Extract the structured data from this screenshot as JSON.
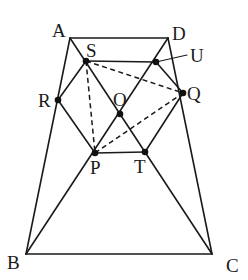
{
  "figure": {
    "type": "geometry-diagram"
  },
  "points": {
    "A": {
      "label": "A",
      "x": 70,
      "y": 38
    },
    "D": {
      "label": "D",
      "x": 168,
      "y": 38
    },
    "B": {
      "label": "B",
      "x": 26,
      "y": 254
    },
    "C": {
      "label": "C",
      "x": 212,
      "y": 254
    },
    "S": {
      "label": "S",
      "x": 86,
      "y": 61
    },
    "U": {
      "label": "U",
      "x": 156,
      "y": 62
    },
    "R": {
      "label": "R",
      "x": 58,
      "y": 100
    },
    "Q": {
      "label": "Q",
      "x": 183,
      "y": 93
    },
    "O": {
      "label": "O",
      "x": 120,
      "y": 114
    },
    "P": {
      "label": "P",
      "x": 95,
      "y": 153
    },
    "T": {
      "label": "T",
      "x": 145,
      "y": 152
    }
  },
  "solid_segments": [
    [
      "A",
      "D"
    ],
    [
      "A",
      "B"
    ],
    [
      "D",
      "C"
    ],
    [
      "B",
      "C"
    ],
    [
      "A",
      "C"
    ],
    [
      "D",
      "B"
    ],
    [
      "S",
      "U"
    ],
    [
      "U",
      "Q"
    ],
    [
      "Q",
      "T"
    ],
    [
      "T",
      "P"
    ],
    [
      "P",
      "R"
    ],
    [
      "R",
      "S"
    ]
  ],
  "dashed_segments": [
    [
      "S",
      "Q"
    ],
    [
      "S",
      "P"
    ],
    [
      "P",
      "Q"
    ]
  ],
  "marked_points": [
    "S",
    "U",
    "R",
    "Q",
    "O",
    "P",
    "T"
  ],
  "labels": {
    "A": "A",
    "B": "B",
    "C": "C",
    "D": "D",
    "S": "S",
    "U": "U",
    "R": "R",
    "Q": "Q",
    "O": "O",
    "P": "P",
    "T": "T"
  }
}
